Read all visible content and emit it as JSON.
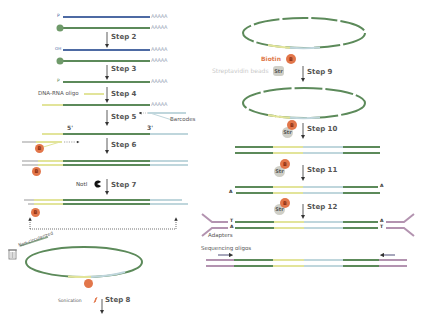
{
  "colors": {
    "rna_blue": "#4d6aa3",
    "dna_green": "#5c8a5a",
    "oligo_yellow": "#e2e49a",
    "barcode_blue": "#bfd6dc",
    "adapter_purple": "#b393b0",
    "biotin_orange": "#e2764a",
    "strept_gray": "#cfcfc7",
    "arrow_dark": "#333333"
  },
  "left_column": {
    "step1": {
      "label_p": "P",
      "label_cap": "Cap",
      "polyA": "AAAAA"
    },
    "step2": {
      "label": "Step 2",
      "label_oh": "OH",
      "polyA": "AAAAA"
    },
    "step3": {
      "label": "Step 3",
      "label_p": "P",
      "polyA": "AAAAA"
    },
    "step4": {
      "label": "Step 4",
      "oligo_label": "DNA-RNA oligo",
      "polyA": "AAAAA"
    },
    "step5": {
      "label": "Step 5",
      "barcodes_label": "Barcodes",
      "five_prime": "5'",
      "three_prime": "3'"
    },
    "step6": {
      "label": "Step 6",
      "bead": "B"
    },
    "step7": {
      "label": "Step 7",
      "enzyme_label": "NotI",
      "bead": "B"
    },
    "discard": {
      "label": "Non-circularized"
    },
    "step8": {
      "label": "Step 8",
      "sonication_label": "Sonication"
    }
  },
  "right_column": {
    "step9": {
      "label": "Step 9",
      "biotin_label": "Biotin",
      "bead": "B",
      "strept_label": "Streptavidin beads",
      "strept": "Str"
    },
    "step10": {
      "label": "Step 10",
      "bead": "B",
      "strept": "Str"
    },
    "step11": {
      "label": "Step 11",
      "bead": "B",
      "strept": "Str",
      "end_a_left": "A",
      "end_a_right": "A"
    },
    "step12": {
      "label": "Step 12",
      "bead": "B",
      "strept": "Str",
      "end_t_left": "T",
      "end_a_left": "A",
      "end_a_right": "A",
      "end_t_right": "T",
      "adapters_label": "Adapters"
    },
    "sequencing": {
      "label": "Sequencing oligos"
    }
  }
}
